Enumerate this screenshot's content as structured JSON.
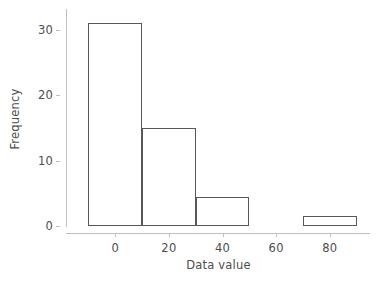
{
  "chart_data": {
    "type": "bar",
    "title": "",
    "subtitle": "",
    "xlabel": "Data value",
    "ylabel": "Frequency",
    "xlim": [
      -18,
      95
    ],
    "ylim": [
      0,
      33
    ],
    "grid": false,
    "legend": null,
    "bin_width": 20,
    "bin_edges": [
      -10,
      10,
      30,
      50,
      70,
      90
    ],
    "categories": [
      "-10 to 10",
      "10 to 30",
      "30 to 50",
      "50 to 70",
      "70 to 90"
    ],
    "bin_centers": [
      0,
      20,
      40,
      60,
      80
    ],
    "values": [
      31,
      15,
      4.5,
      0,
      1.5
    ],
    "bars": [
      {
        "label": "-10 to 10",
        "left": -10,
        "right": 10,
        "value": 31
      },
      {
        "label": "10 to 30",
        "left": 10,
        "right": 30,
        "value": 15
      },
      {
        "label": "30 to 50",
        "left": 30,
        "right": 50,
        "value": 4.5
      },
      {
        "label": "70 to 90",
        "left": 70,
        "right": 90,
        "value": 1.5
      }
    ],
    "xticks": [
      {
        "value": 0,
        "label": "0"
      },
      {
        "value": 20,
        "label": "20"
      },
      {
        "value": 40,
        "label": "40"
      },
      {
        "value": 60,
        "label": "60"
      },
      {
        "value": 80,
        "label": "80"
      }
    ],
    "yticks": [
      {
        "value": 0,
        "label": "0"
      },
      {
        "value": 10,
        "label": "10"
      },
      {
        "value": 20,
        "label": "20"
      },
      {
        "value": 30,
        "label": "30"
      }
    ],
    "colors": {
      "bar_edge": "#55595c",
      "bar_fill": "#ffffff",
      "axis": "#bfbfbf",
      "text": "#4d4d4d",
      "background": "#ffffff"
    }
  }
}
